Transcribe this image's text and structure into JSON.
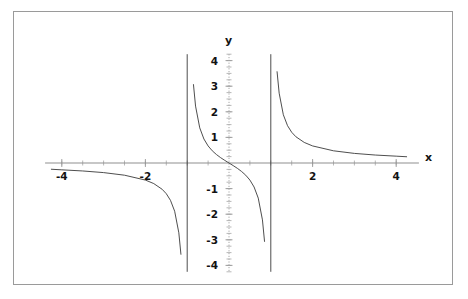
{
  "chart_data": {
    "type": "line",
    "title": "",
    "xlabel": "x",
    "ylabel": "y",
    "xlim": [
      -4.4,
      4.4
    ],
    "ylim": [
      -4.25,
      4.25
    ],
    "grid": false,
    "legend": "none",
    "function": "y = x / (x^2 - 1)",
    "vertical_asymptotes": [
      -1,
      1
    ],
    "xticks_major": [
      -4,
      -2,
      2,
      4
    ],
    "xtick_labels": [
      "-4",
      "-2",
      "2",
      "4"
    ],
    "yticks_major": [
      4,
      3,
      2,
      1,
      -1,
      -2,
      -3,
      -4
    ],
    "ytick_labels": [
      "4",
      "3",
      "2",
      "1",
      "-1",
      "-2",
      "-3",
      "-4"
    ],
    "xticks_minor_step": 0.5,
    "yticks_minor_step": 0.25,
    "series": [
      {
        "name": "left-branch",
        "comment": "x from -4.25 to just left of -1; y negative, goes to -infinity",
        "x": [
          -4.25,
          -4.0,
          -3.5,
          -3.0,
          -2.5,
          -2.0,
          -1.8,
          -1.6,
          -1.5,
          -1.4,
          -1.3,
          -1.2,
          -1.15,
          -1.1,
          -1.07,
          -1.05,
          -1.03,
          -1.015
        ],
        "y": [
          -0.2443,
          -0.2667,
          -0.3111,
          -0.375,
          -0.4762,
          -0.6667,
          -0.8036,
          -1.0256,
          -1.2,
          -1.4583,
          -1.8841,
          -2.7273,
          -3.5659,
          -5.2381,
          -7.2464,
          -10.2439,
          -16.9,
          -33.4
        ]
      },
      {
        "name": "middle-branch",
        "comment": "x between -1 and 1, passes through origin with negative slope",
        "x": [
          -0.985,
          -0.97,
          -0.95,
          -0.93,
          -0.9,
          -0.85,
          -0.8,
          -0.7,
          -0.6,
          -0.5,
          -0.4,
          -0.3,
          -0.2,
          -0.1,
          0.0,
          0.1,
          0.2,
          0.3,
          0.4,
          0.5,
          0.6,
          0.7,
          0.8,
          0.85,
          0.9,
          0.93,
          0.95,
          0.97,
          0.985
        ],
        "y": [
          33.1,
          16.4,
          9.744,
          6.905,
          4.7368,
          3.0631,
          2.2222,
          1.3725,
          0.9375,
          0.6667,
          0.4762,
          0.3297,
          0.2083,
          0.101,
          0.0,
          -0.101,
          -0.2083,
          -0.3297,
          -0.4762,
          -0.6667,
          -0.9375,
          -1.3725,
          -2.2222,
          -3.0631,
          -4.7368,
          -6.905,
          -9.744,
          -16.4,
          -33.1
        ]
      },
      {
        "name": "right-branch",
        "comment": "x from just right of 1 to 4.25; y positive, decays toward 0",
        "x": [
          1.015,
          1.03,
          1.05,
          1.07,
          1.1,
          1.15,
          1.2,
          1.3,
          1.4,
          1.5,
          1.6,
          1.8,
          2.0,
          2.5,
          3.0,
          3.5,
          4.0,
          4.25
        ],
        "y": [
          33.4,
          16.9,
          10.2439,
          7.2464,
          5.2381,
          3.5659,
          2.7273,
          1.8841,
          1.4583,
          1.2,
          1.0256,
          0.8036,
          0.6667,
          0.4762,
          0.375,
          0.3111,
          0.2667,
          0.2443
        ]
      }
    ],
    "colors": {
      "curve": "#3a3a3a",
      "asymptote": "#3a3a3a",
      "x_axis": "#8f8f8f",
      "y_axis": "#a8a8a8",
      "tick": "#9a9a9a",
      "border": "#9a9a9a",
      "text": "#121212",
      "background": "#ffffff"
    }
  }
}
